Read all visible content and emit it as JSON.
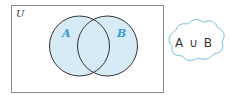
{
  "diagram": {
    "type": "venn",
    "universe_label": "U",
    "sets": [
      {
        "label": "A",
        "fill": "#d6ebf5"
      },
      {
        "label": "B",
        "fill": "#d6ebf5"
      }
    ],
    "shaded_region": "A ∪ B",
    "callout": "A ∪ B",
    "colors": {
      "label": "#3a9bd0",
      "outline": "#333333",
      "fill": "#d6ebf5",
      "cloud_outline": "#7fc0e0"
    }
  }
}
